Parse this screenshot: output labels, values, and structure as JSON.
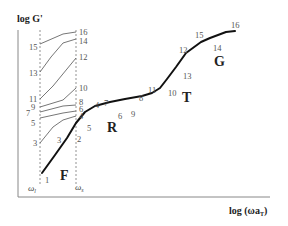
{
  "diagram": {
    "y_axis_label": "log G'",
    "x_axis_label": "log (ωa",
    "x_axis_label_sub": "T",
    "x_axis_label_close": ")",
    "omega_left": "ω",
    "omega_left_sub": "l",
    "omega_right": "ω",
    "omega_right_sub": "s",
    "regions": [
      {
        "label": "F",
        "x": 60,
        "y": 180
      },
      {
        "label": "R",
        "x": 107,
        "y": 132
      },
      {
        "label": "T",
        "x": 182,
        "y": 102
      },
      {
        "label": "G",
        "x": 214,
        "y": 66
      }
    ],
    "colors": {
      "main_curve": "#111111",
      "thin_lines": "#666666",
      "axis": "#888888",
      "dashed": "#777777",
      "labels": "#555555"
    },
    "main_curve_points": [
      [
        42,
        173
      ],
      [
        55,
        155
      ],
      [
        67,
        138
      ],
      [
        76,
        123
      ],
      [
        85,
        112
      ],
      [
        95,
        106
      ],
      [
        110,
        102
      ],
      [
        125,
        99
      ],
      [
        142,
        96
      ],
      [
        152,
        93
      ],
      [
        160,
        88
      ],
      [
        167,
        79
      ],
      [
        176,
        67
      ],
      [
        186,
        53
      ],
      [
        201,
        42
      ],
      [
        210,
        38
      ],
      [
        226,
        32
      ],
      [
        235,
        31
      ]
    ],
    "thin_lines": [
      {
        "from": "15",
        "to": "16",
        "points": [
          [
            40,
            44
          ],
          [
            63,
            34
          ],
          [
            76,
            32
          ]
        ]
      },
      {
        "from": "13",
        "to": "14",
        "points": [
          [
            40,
            72
          ],
          [
            51,
            57
          ],
          [
            63,
            43
          ],
          [
            76,
            39
          ]
        ]
      },
      {
        "from": "11",
        "to": "12",
        "points": [
          [
            40,
            99
          ],
          [
            53,
            86
          ],
          [
            76,
            58
          ]
        ]
      },
      {
        "from": "9",
        "to": "10",
        "points": [
          [
            40,
            107
          ],
          [
            63,
            100
          ],
          [
            76,
            88
          ]
        ]
      },
      {
        "from": "7",
        "to": "8",
        "points": [
          [
            40,
            112
          ],
          [
            63,
            106
          ],
          [
            76,
            105
          ]
        ]
      },
      {
        "from": "5",
        "to": "6",
        "points": [
          [
            40,
            118
          ],
          [
            63,
            113
          ],
          [
            76,
            111
          ]
        ]
      },
      {
        "from": "3",
        "to": "4",
        "points": [
          [
            40,
            143
          ],
          [
            53,
            127
          ],
          [
            63,
            120
          ],
          [
            76,
            116
          ]
        ]
      }
    ],
    "point_labels": [
      {
        "text": "16",
        "x": 79,
        "y": 35
      },
      {
        "text": "15",
        "x": 29,
        "y": 50
      },
      {
        "text": "14",
        "x": 79,
        "y": 44
      },
      {
        "text": "13",
        "x": 29,
        "y": 76
      },
      {
        "text": "12",
        "x": 79,
        "y": 60
      },
      {
        "text": "11",
        "x": 29,
        "y": 102
      },
      {
        "text": "10",
        "x": 79,
        "y": 91
      },
      {
        "text": "9",
        "x": 31,
        "y": 110
      },
      {
        "text": "8",
        "x": 79,
        "y": 105
      },
      {
        "text": "7",
        "x": 26,
        "y": 116
      },
      {
        "text": "6",
        "x": 79,
        "y": 112
      },
      {
        "text": "5",
        "x": 31,
        "y": 126
      },
      {
        "text": "4",
        "x": 79,
        "y": 119
      },
      {
        "text": "3",
        "x": 33,
        "y": 146
      },
      {
        "text": "3",
        "x": 57,
        "y": 143
      },
      {
        "text": "2",
        "x": 77,
        "y": 142
      },
      {
        "text": "1",
        "x": 45,
        "y": 183
      },
      {
        "text": "5",
        "x": 87,
        "y": 131
      },
      {
        "text": "4",
        "x": 95,
        "y": 108
      },
      {
        "text": "7",
        "x": 104,
        "y": 106
      },
      {
        "text": "6",
        "x": 118,
        "y": 119
      },
      {
        "text": "9",
        "x": 131,
        "y": 117
      },
      {
        "text": "8",
        "x": 139,
        "y": 101
      },
      {
        "text": "11",
        "x": 148,
        "y": 93
      },
      {
        "text": "10",
        "x": 168,
        "y": 96
      },
      {
        "text": "13",
        "x": 183,
        "y": 79
      },
      {
        "text": "12",
        "x": 179,
        "y": 53
      },
      {
        "text": "15",
        "x": 195,
        "y": 38
      },
      {
        "text": "14",
        "x": 213,
        "y": 51
      },
      {
        "text": "16",
        "x": 231,
        "y": 28
      }
    ]
  }
}
